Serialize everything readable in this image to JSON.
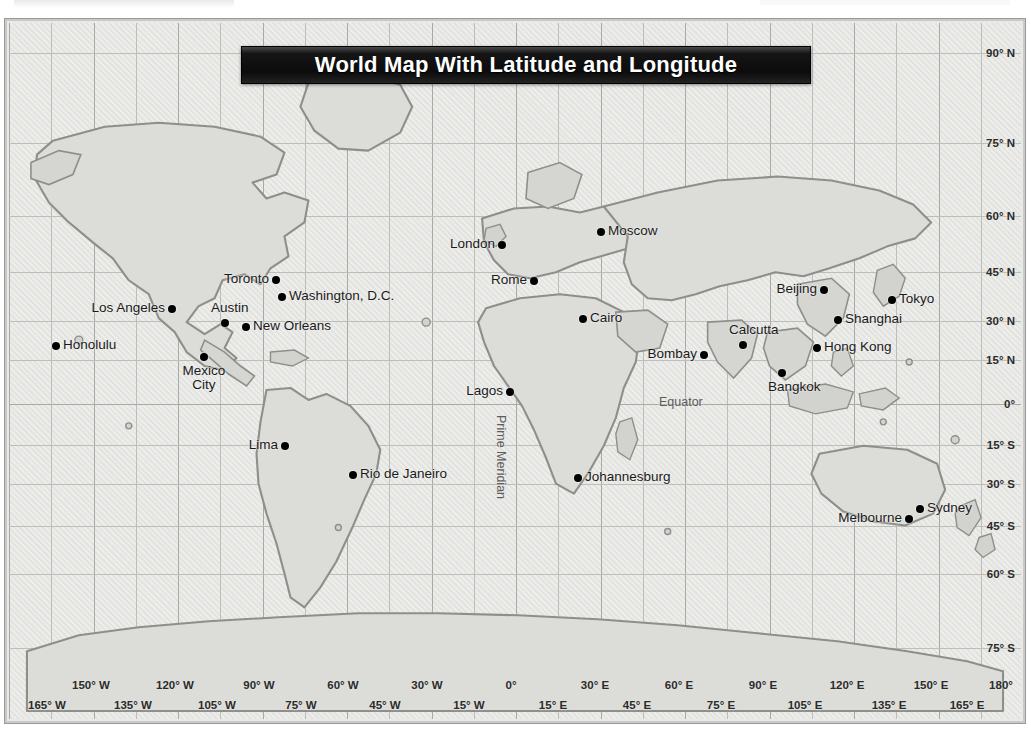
{
  "map": {
    "title": "World Map With Latitude and Longitude",
    "equator_label": "Equator",
    "prime_meridian_label": "Prime Meridian",
    "colors": {
      "ocean": "#e3e3e0",
      "land": "#dcdcd8",
      "coastline": "#8e8e8a",
      "graticule": "#a9a9a6",
      "banner": "#0c0c0c",
      "banner_text": "#ffffff",
      "marker": "#000000"
    }
  },
  "latitude_labels": [
    {
      "text": "90° N",
      "y": 30
    },
    {
      "text": "75° N",
      "y": 120
    },
    {
      "text": "60° N",
      "y": 193
    },
    {
      "text": "45° N",
      "y": 249
    },
    {
      "text": "30° N",
      "y": 298
    },
    {
      "text": "15° N",
      "y": 337
    },
    {
      "text": "0°",
      "y": 381
    },
    {
      "text": "15° S",
      "y": 422
    },
    {
      "text": "30° S",
      "y": 461
    },
    {
      "text": "45° S",
      "y": 503
    },
    {
      "text": "60° S",
      "y": 551
    },
    {
      "text": "75° S",
      "y": 625
    },
    {
      "text": "90° S",
      "y": 710
    }
  ],
  "longitude_labels_upper": [
    {
      "text": "150° W",
      "x": 82
    },
    {
      "text": "120° W",
      "x": 166
    },
    {
      "text": "90° W",
      "x": 250
    },
    {
      "text": "60° W",
      "x": 334
    },
    {
      "text": "30° W",
      "x": 418
    },
    {
      "text": "0°",
      "x": 502
    },
    {
      "text": "30° E",
      "x": 586
    },
    {
      "text": "60° E",
      "x": 670
    },
    {
      "text": "90° E",
      "x": 754
    },
    {
      "text": "120° E",
      "x": 838
    },
    {
      "text": "150° E",
      "x": 922
    },
    {
      "text": "180°",
      "x": 992
    }
  ],
  "longitude_labels_lower": [
    {
      "text": "165° W",
      "x": 38
    },
    {
      "text": "135° W",
      "x": 124
    },
    {
      "text": "105° W",
      "x": 208
    },
    {
      "text": "75° W",
      "x": 292
    },
    {
      "text": "45° W",
      "x": 376
    },
    {
      "text": "15° W",
      "x": 460
    },
    {
      "text": "15° E",
      "x": 544
    },
    {
      "text": "45° E",
      "x": 628
    },
    {
      "text": "75° E",
      "x": 712
    },
    {
      "text": "105° E",
      "x": 796
    },
    {
      "text": "135° E",
      "x": 880
    },
    {
      "text": "165° E",
      "x": 958
    }
  ],
  "cities": [
    {
      "name": "Honolulu",
      "x": 47,
      "y": 323,
      "pos": "right"
    },
    {
      "name": "Los Angeles",
      "x": 163,
      "y": 286,
      "pos": "left"
    },
    {
      "name": "Austin",
      "x": 216,
      "y": 300,
      "pos": "above"
    },
    {
      "name": "Mexico City",
      "x": 195,
      "y": 334,
      "pos": "below-c"
    },
    {
      "name": "New Orleans",
      "x": 237,
      "y": 304,
      "pos": "right"
    },
    {
      "name": "Toronto",
      "x": 267,
      "y": 257,
      "pos": "left"
    },
    {
      "name": "Washington, D.C.",
      "x": 273,
      "y": 274,
      "pos": "right"
    },
    {
      "name": "Lima",
      "x": 276,
      "y": 423,
      "pos": "left"
    },
    {
      "name": "Rio de Janeiro",
      "x": 344,
      "y": 452,
      "pos": "right"
    },
    {
      "name": "London",
      "x": 493,
      "y": 222,
      "pos": "left"
    },
    {
      "name": "Moscow",
      "x": 592,
      "y": 209,
      "pos": "right"
    },
    {
      "name": "Rome",
      "x": 525,
      "y": 258,
      "pos": "left"
    },
    {
      "name": "Cairo",
      "x": 574,
      "y": 296,
      "pos": "right"
    },
    {
      "name": "Lagos",
      "x": 501,
      "y": 369,
      "pos": "left"
    },
    {
      "name": "Johannesburg",
      "x": 569,
      "y": 455,
      "pos": "right"
    },
    {
      "name": "Bombay",
      "x": 695,
      "y": 332,
      "pos": "left"
    },
    {
      "name": "Calcutta",
      "x": 734,
      "y": 322,
      "pos": "above"
    },
    {
      "name": "Bangkok",
      "x": 773,
      "y": 350,
      "pos": "below"
    },
    {
      "name": "Beijing",
      "x": 815,
      "y": 267,
      "pos": "left"
    },
    {
      "name": "Shanghai",
      "x": 829,
      "y": 297,
      "pos": "right"
    },
    {
      "name": "Hong Kong",
      "x": 808,
      "y": 325,
      "pos": "right"
    },
    {
      "name": "Tokyo",
      "x": 883,
      "y": 277,
      "pos": "right"
    },
    {
      "name": "Sydney",
      "x": 911,
      "y": 486,
      "pos": "right"
    },
    {
      "name": "Melbourne",
      "x": 900,
      "y": 496,
      "pos": "left"
    }
  ]
}
